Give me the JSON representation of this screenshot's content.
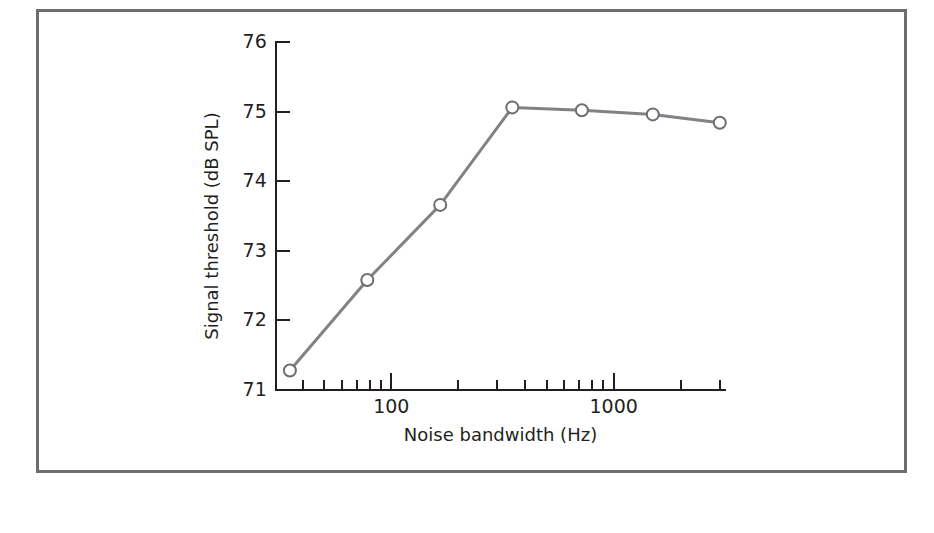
{
  "figure": {
    "background_color": "#ffffff",
    "frame_color": "#6d6e71",
    "line_color": "#808285",
    "marker_fill": "#ffffff",
    "marker_edge": "#6d6e71",
    "axis_color": "#231f20"
  },
  "chart_data": {
    "type": "line",
    "title": "",
    "xlabel": "Noise bandwidth (Hz)",
    "ylabel": "Signal threshold (dB SPL)",
    "xscale": "log",
    "yscale": "linear",
    "xlim": [
      30,
      3200
    ],
    "ylim": [
      71,
      76
    ],
    "grid": false,
    "legend": null,
    "x_tick_labels": [
      "100",
      "1000"
    ],
    "x_tick_values": [
      100,
      1000
    ],
    "x_minor_tick_values": [
      40,
      50,
      60,
      70,
      80,
      90,
      200,
      300,
      400,
      500,
      600,
      700,
      800,
      900,
      2000,
      3000
    ],
    "y_tick_labels": [
      "71",
      "72",
      "73",
      "74",
      "75",
      "76"
    ],
    "y_tick_values": [
      71,
      72,
      73,
      74,
      75,
      76
    ],
    "series": [
      {
        "name": "Signal threshold",
        "marker": "open-circle",
        "x": [
          35,
          78,
          166,
          350,
          720,
          1500,
          3000
        ],
        "y": [
          71.28,
          72.58,
          73.66,
          75.06,
          75.02,
          74.96,
          74.84
        ]
      }
    ]
  }
}
